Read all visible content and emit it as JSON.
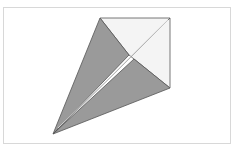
{
  "diagram": {
    "type": "origami-fold",
    "colors": {
      "paper_back": "#9a9a9a",
      "paper_front": "#f4f4f4",
      "edge": "#555555",
      "frame": "#d8d8d8"
    },
    "points": {
      "top_left": [
        100,
        18
      ],
      "top_right": [
        170,
        18
      ],
      "right": [
        170,
        88
      ],
      "tip": [
        53,
        134
      ],
      "center_upper": [
        129,
        55
      ],
      "center_lower": [
        134,
        59
      ]
    }
  }
}
